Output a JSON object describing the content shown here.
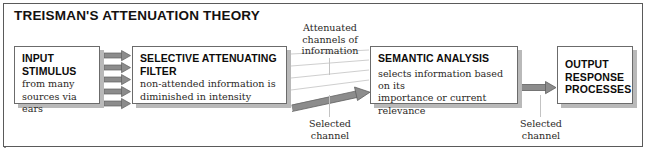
{
  "figure": {
    "title": "TREISMAN'S ATTENUATION THEORY"
  },
  "nodes": {
    "input": {
      "head_line1": "INPUT",
      "head_line2": "STIMULUS",
      "body_line1": "from many",
      "body_line2": "sources via ears"
    },
    "filter": {
      "head_line1": "SELECTIVE ATTENUATING",
      "head_line2": "FILTER",
      "body_line1": "non-attended information is",
      "body_line2": "diminished in intensity"
    },
    "semantic": {
      "head_line1": "SEMANTIC ANALYSIS",
      "body_line1": "selects information based on its",
      "body_line2": "importance or current relevance"
    },
    "output": {
      "head_line1": "OUTPUT",
      "head_line2": "RESPONSE",
      "head_line3": "PROCESSES"
    }
  },
  "annotations": {
    "attenuated": {
      "line1": "Attenuated",
      "line2": "channels of",
      "line3": "information"
    },
    "selected_left": {
      "line1": "Selected",
      "line2": "channel"
    },
    "selected_right": {
      "line1": "Selected",
      "line2": "channel"
    }
  },
  "colors": {
    "frame_border": "#5a5a5a",
    "node_border": "#6b6b6b",
    "node_shadow": "#b9b9b9",
    "arrow_fill": "#8c8c8c",
    "arrow_stroke": "#5f5f5f",
    "thin_channel": "#cfcfcf",
    "leader": "#c3c3c3",
    "text": "#14110f",
    "background": "#ffffff"
  },
  "input_arrow_count": 5,
  "attenuated_channel_count": 4
}
